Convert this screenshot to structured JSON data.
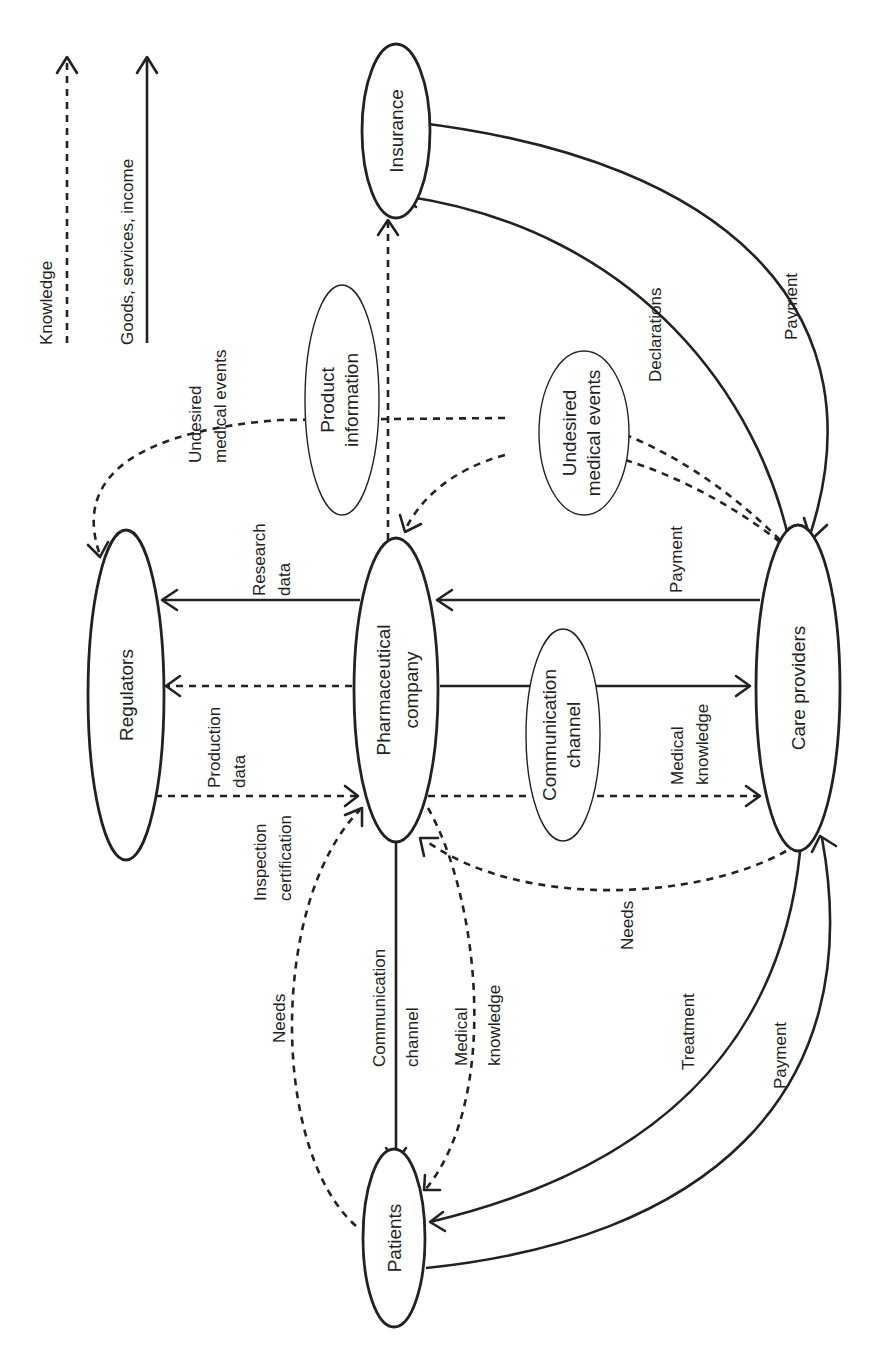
{
  "legend": {
    "knowledge": "Knowledge",
    "goods": "Goods, services, income"
  },
  "nodes": {
    "insurance": "Insurance",
    "regulators": "Regulators",
    "pharma_line1": "Pharmaceutical",
    "pharma_line2": "company",
    "care_providers": "Care providers",
    "patients": "Patients",
    "product_info_line1": "Product",
    "product_info_line2": "information",
    "ume_mid_line1": "Undesired",
    "ume_mid_line2": "medical events",
    "comm_channel_line1": "Communication",
    "comm_channel_line2": "channel"
  },
  "edges": {
    "ume_regulators_line1": "Undesired",
    "ume_regulators_line2": "medical events",
    "declarations": "Declarations",
    "payment_insurance": "Payment",
    "research_line1": "Research",
    "research_line2": "data",
    "payment_care_pharma": "Payment",
    "production_line1": "Production",
    "production_line2": "data",
    "inspection_line1": "Inspection",
    "inspection_line2": "certification",
    "medknow_care_line1": "Medical",
    "medknow_care_line2": "knowledge",
    "needs_care": "Needs",
    "needs_patients": "Needs",
    "comm_patients_line1": "Communication",
    "comm_patients_line2": "channel",
    "medknow_patients_line1": "Medical",
    "medknow_patients_line2": "knowledge",
    "treatment": "Treatment",
    "payment_patients": "Payment"
  }
}
